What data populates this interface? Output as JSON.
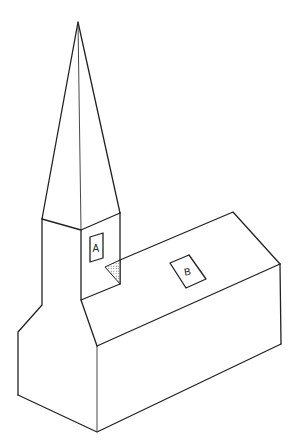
{
  "diagram": {
    "labels": {
      "a": "A",
      "b": "B"
    },
    "colors": {
      "line": "#222222",
      "background": "#ffffff",
      "hatch": "#777777"
    }
  }
}
